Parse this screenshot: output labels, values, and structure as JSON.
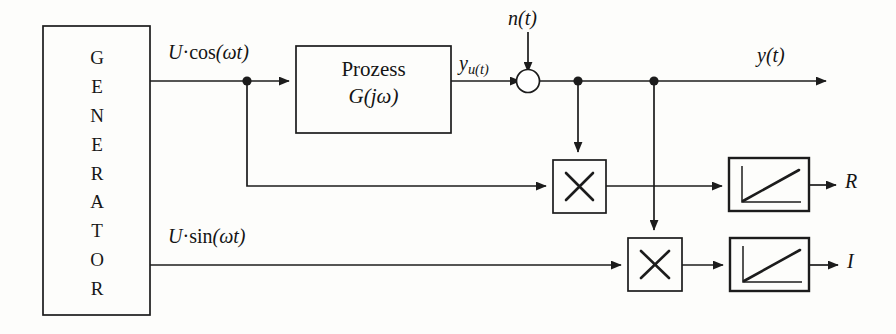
{
  "diagram": {
    "blocks": {
      "generator": {
        "label": "GENERATOR",
        "letters": [
          "G",
          "E",
          "N",
          "E",
          "R",
          "A",
          "T",
          "O",
          "R"
        ]
      },
      "process": {
        "line1": "Prozess",
        "line2": "G(jω)"
      },
      "multiplier_upper": {
        "symbol": "×"
      },
      "multiplier_lower": {
        "symbol": "×"
      },
      "integrator_upper": {
        "symbol": "ramp-integrator"
      },
      "integrator_lower": {
        "symbol": "ramp-integrator"
      },
      "summing_junction": {
        "symbol": "circle-sum"
      }
    },
    "signals": {
      "cos_input": {
        "coef": "U",
        "dot": "·",
        "func": "cos",
        "arg": "(ωt)"
      },
      "sin_input": {
        "coef": "U",
        "dot": "·",
        "func": "sin",
        "arg": "(ωt)"
      },
      "process_output_base": "y",
      "process_output_sub": "u(t)",
      "noise": "n(t)",
      "measured_output": "y(t)",
      "real_part": "R",
      "imag_part": "I"
    },
    "colors": {
      "background": "#fdfdfb",
      "stroke": "#1c1c1c",
      "text": "#141414"
    }
  }
}
